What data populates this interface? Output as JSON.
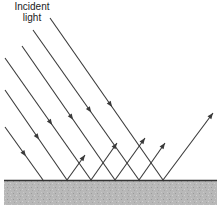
{
  "title_line1": "Incident",
  "title_line2": "light",
  "diagram": {
    "type": "specular-reflection",
    "surface_y": 180,
    "surface_color": "#333333",
    "ground_color": "#b5b5b5",
    "line_color": "#3a3a3a",
    "rays": [
      {
        "start": [
          5,
          127
        ],
        "hit": [
          43,
          180
        ],
        "reflect_end": null
      },
      {
        "start": [
          5,
          90
        ],
        "hit": [
          67,
          180
        ],
        "reflect_end": [
          85,
          155
        ]
      },
      {
        "start": [
          5,
          58
        ],
        "hit": [
          91,
          180
        ],
        "reflect_end": [
          117,
          143
        ]
      },
      {
        "start": [
          22,
          46
        ],
        "hit": [
          115,
          180
        ],
        "reflect_end": [
          145,
          138
        ]
      },
      {
        "start": [
          33,
          30
        ],
        "hit": [
          139,
          180
        ],
        "reflect_end": [
          165,
          143
        ]
      },
      {
        "start": [
          50,
          18
        ],
        "hit": [
          163,
          180
        ],
        "reflect_end": [
          213,
          113
        ]
      }
    ]
  }
}
